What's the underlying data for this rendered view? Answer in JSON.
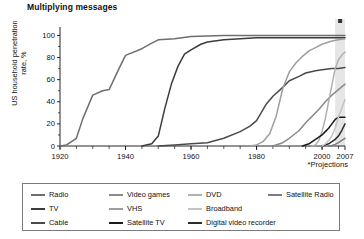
{
  "title": "Multiplying messages",
  "axes": {
    "ylabel": "US household penetration rate, %",
    "yticks": [
      "0",
      "20",
      "40",
      "60",
      "80",
      "100"
    ],
    "ylim": [
      0,
      100
    ],
    "xticks": [
      "1920",
      "1940",
      "1960",
      "1980",
      "2000",
      "2007"
    ],
    "xlim": [
      1920,
      2007
    ],
    "footnote": "*Projections"
  },
  "legend": {
    "items": [
      {
        "label": "Radio",
        "color": "#6e6e6e",
        "col": 0,
        "row": 0
      },
      {
        "label": "TV",
        "color": "#3c3c3c",
        "col": 0,
        "row": 1
      },
      {
        "label": "Cable",
        "color": "#4a4a4a",
        "col": 0,
        "row": 2
      },
      {
        "label": "Video games",
        "color": "#8a8a8a",
        "col": 1,
        "row": 0
      },
      {
        "label": "VHS",
        "color": "#9e9e9e",
        "col": 1,
        "row": 1
      },
      {
        "label": "Satellite TV",
        "color": "#1a1a1a",
        "col": 1,
        "row": 2
      },
      {
        "label": "DVD",
        "color": "#b0b0b0",
        "col": 2,
        "row": 0
      },
      {
        "label": "Broadband",
        "color": "#c4c4c4",
        "col": 2,
        "row": 1
      },
      {
        "label": "Digital video recorder",
        "color": "#2b2b2b",
        "col": 2,
        "row": 2
      },
      {
        "label": "Satellite Radio",
        "color": "#7d7d7d",
        "col": 3,
        "row": 0
      }
    ]
  },
  "projection_band": {
    "start_year": 2004,
    "end_year": 2007,
    "fill": "#e6e6e6",
    "marker_color": "#333333"
  },
  "chart_data": {
    "type": "line",
    "title": "Multiplying messages",
    "xlabel": "",
    "ylabel": "US household penetration rate, %",
    "xlim": [
      1920,
      2007
    ],
    "ylim": [
      0,
      104
    ],
    "grid": false,
    "legend_position": "bottom",
    "annotations": [
      "*Projections"
    ],
    "series": [
      {
        "name": "Radio",
        "color": "#6e6e6e",
        "x": [
          1920,
          1922,
          1925,
          1927,
          1930,
          1933,
          1935,
          1938,
          1940,
          1945,
          1948,
          1950,
          1955,
          1960,
          1970,
          1980,
          1990,
          2000,
          2007
        ],
        "values": [
          0,
          1,
          7,
          25,
          46,
          50,
          51,
          70,
          82,
          88,
          93,
          96,
          97,
          99,
          100,
          100,
          100,
          100,
          100
        ]
      },
      {
        "name": "TV",
        "color": "#3c3c3c",
        "x": [
          1945,
          1948,
          1950,
          1952,
          1954,
          1956,
          1958,
          1960,
          1963,
          1965,
          1970,
          1975,
          1980,
          1990,
          2000,
          2007
        ],
        "values": [
          0,
          2,
          9,
          34,
          56,
          72,
          83,
          87,
          92,
          94,
          96,
          97,
          98,
          98,
          98,
          98
        ]
      },
      {
        "name": "Cable",
        "color": "#4a4a4a",
        "x": [
          1950,
          1955,
          1960,
          1965,
          1970,
          1975,
          1978,
          1980,
          1983,
          1985,
          1988,
          1990,
          1993,
          1995,
          1998,
          2000,
          2003,
          2005,
          2007
        ],
        "values": [
          0,
          1,
          2,
          3,
          7,
          13,
          18,
          23,
          38,
          45,
          53,
          59,
          63,
          66,
          68,
          69,
          70,
          70,
          71
        ]
      },
      {
        "name": "VHS",
        "color": "#9e9e9e",
        "x": [
          1978,
          1980,
          1982,
          1984,
          1986,
          1988,
          1990,
          1992,
          1994,
          1996,
          1998,
          2000,
          2003,
          2005,
          2007
        ],
        "values": [
          0,
          1,
          4,
          11,
          27,
          52,
          67,
          75,
          81,
          86,
          89,
          92,
          95,
          96,
          97
        ]
      },
      {
        "name": "Video games",
        "color": "#8a8a8a",
        "x": [
          1985,
          1988,
          1990,
          1993,
          1995,
          1997,
          1999,
          2001,
          2003,
          2005,
          2007
        ],
        "values": [
          0,
          3,
          7,
          14,
          21,
          27,
          33,
          40,
          46,
          51,
          56
        ]
      },
      {
        "name": "DVD",
        "color": "#b0b0b0",
        "x": [
          1997,
          1998,
          1999,
          2000,
          2001,
          2002,
          2003,
          2004,
          2005,
          2006,
          2007
        ],
        "values": [
          0,
          1,
          5,
          13,
          25,
          40,
          55,
          70,
          78,
          82,
          85
        ]
      },
      {
        "name": "Satellite TV",
        "color": "#1a1a1a",
        "x": [
          1994,
          1996,
          1998,
          2000,
          2001,
          2002,
          2003,
          2004,
          2005,
          2006,
          2007
        ],
        "values": [
          0,
          2,
          6,
          10,
          13,
          16,
          20,
          24,
          26,
          26,
          26
        ]
      },
      {
        "name": "Digital video recorder",
        "color": "#2b2b2b",
        "x": [
          2000,
          2001,
          2002,
          2003,
          2004,
          2005,
          2006,
          2007
        ],
        "values": [
          0,
          1,
          2,
          4,
          6,
          9,
          14,
          20
        ]
      },
      {
        "name": "Broadband",
        "color": "#c4c4c4",
        "x": [
          2000,
          2001,
          2002,
          2003,
          2004,
          2005,
          2006,
          2007
        ],
        "values": [
          0,
          2,
          5,
          9,
          16,
          26,
          34,
          42
        ]
      },
      {
        "name": "Satellite Radio",
        "color": "#7d7d7d",
        "x": [
          2002,
          2003,
          2004,
          2005,
          2006,
          2007
        ],
        "values": [
          0,
          0.5,
          1.5,
          3,
          5,
          7
        ]
      }
    ]
  }
}
